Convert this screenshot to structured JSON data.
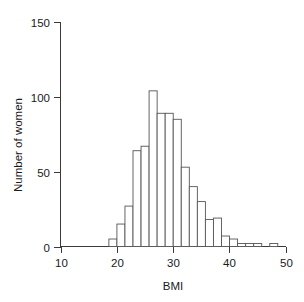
{
  "chart_data": {
    "type": "bar",
    "title": "",
    "subtitle": "",
    "xlabel": "BMI",
    "ylabel": "Number of women",
    "xlim": [
      10,
      50
    ],
    "ylim": [
      0,
      150
    ],
    "xticks": [
      10,
      20,
      30,
      40,
      50
    ],
    "xtick_labels": [
      "10",
      "20",
      "30",
      "40",
      "50"
    ],
    "yticks": [
      0,
      50,
      100,
      150
    ],
    "ytick_labels": [
      "0",
      "50",
      "100",
      "150"
    ],
    "grid": false,
    "legend": "none",
    "bin_width": 1.43,
    "bin_starts": [
      18.6,
      20.03,
      21.46,
      22.89,
      24.32,
      25.75,
      27.18,
      28.61,
      30.04,
      31.47,
      32.9,
      34.33,
      35.76,
      37.19,
      38.62,
      40.05,
      41.48,
      42.91,
      44.34,
      45.77,
      47.2
    ],
    "categories": [
      "18.6-20.0",
      "20.0-21.5",
      "21.5-22.9",
      "22.9-24.3",
      "24.3-25.8",
      "25.8-27.2",
      "27.2-28.6",
      "28.6-30.0",
      "30.0-31.5",
      "31.5-32.9",
      "32.9-34.3",
      "34.3-35.8",
      "35.8-37.2",
      "37.2-38.6",
      "38.6-40.1",
      "40.1-41.5",
      "41.5-42.9",
      "42.9-44.3",
      "44.3-45.8",
      "45.8-47.2",
      "47.2-48.6"
    ],
    "values": [
      5,
      15,
      27,
      64,
      67,
      104,
      89,
      89,
      85,
      53,
      40,
      30,
      18,
      19,
      7,
      5,
      2,
      2,
      2,
      0,
      2
    ]
  },
  "axes": {
    "x_title": "BMI",
    "y_title": "Number of women"
  },
  "colors": {
    "bar_fill": "#ffffff",
    "bar_stroke": "#555555",
    "axis": "#3a3a3a",
    "text": "#1a1a1a",
    "background": "#ffffff"
  }
}
